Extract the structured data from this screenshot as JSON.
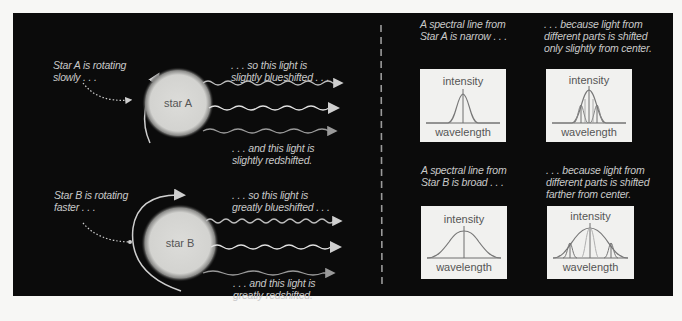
{
  "diagram": {
    "left": {
      "star_a": {
        "label": "star A",
        "rotation_caption": "Star A is rotating\nslowly . . .",
        "blueshift_caption": ". . . so this light is\nslightly blueshifted . . .",
        "redshift_caption": ". . . and this light is\nslightly redshifted."
      },
      "star_b": {
        "label": "star B",
        "rotation_caption": "Star B is rotating\nfaster . . .",
        "blueshift_caption": ". . . so this light is\ngreatly blueshifted . . .",
        "redshift_caption": ". . . and this light is\ngreatly redshifted."
      }
    },
    "right": {
      "row_a": {
        "caption_left": "A spectral line from\nStar A is narrow . . .",
        "caption_right": ". . . because light from\ndifferent parts is shifted\nonly slightly from center.",
        "graph_left": {
          "y_label": "intensity",
          "x_label": "wavelength",
          "shape": "narrow"
        },
        "graph_right": {
          "y_label": "intensity",
          "x_label": "wavelength",
          "shape": "narrow-composite"
        }
      },
      "row_b": {
        "caption_left": "A spectral line from\nStar B is broad . . .",
        "caption_right": ". . . because light from\ndifferent parts is shifted\nfarther from center.",
        "graph_left": {
          "y_label": "intensity",
          "x_label": "wavelength",
          "shape": "broad"
        },
        "graph_right": {
          "y_label": "intensity",
          "x_label": "wavelength",
          "shape": "broad-composite"
        }
      }
    },
    "colors": {
      "background": "#0b0b0b",
      "page": "#f7f7f5",
      "text": "#c9c9c9",
      "star": "#d9d9d6",
      "graph_bg": "#f1f1ef",
      "curve": "#6e6e6e"
    }
  }
}
